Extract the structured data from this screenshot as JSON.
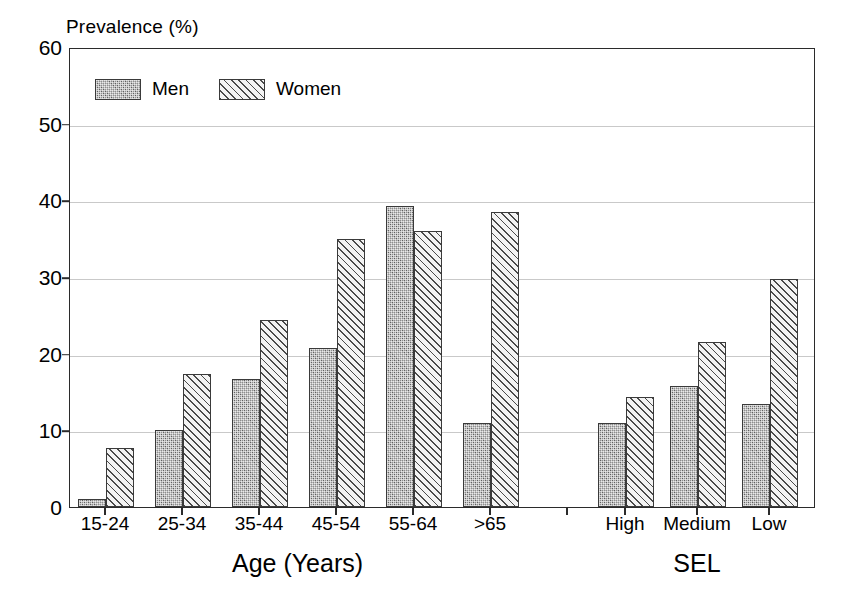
{
  "chart_data": {
    "type": "bar",
    "title": "",
    "ylabel": "Prevalence (%)",
    "xlabel": "",
    "ylim": [
      0,
      60
    ],
    "yticks": [
      0,
      10,
      20,
      30,
      40,
      50,
      60
    ],
    "grid": true,
    "legend_position": "top-left",
    "groups": [
      {
        "name": "Age (Years)",
        "categories": [
          "15-24",
          "25-34",
          "35-44",
          "45-54",
          "55-64",
          ">65"
        ],
        "series": [
          {
            "name": "Men",
            "values": [
              1.0,
              10.0,
              16.7,
              20.7,
              39.3,
              11.0
            ]
          },
          {
            "name": "Women",
            "values": [
              7.7,
              17.3,
              24.4,
              35.0,
              36.0,
              38.5
            ]
          }
        ]
      },
      {
        "name": "SEL",
        "categories": [
          "High",
          "Medium",
          "Low"
        ],
        "series": [
          {
            "name": "Men",
            "values": [
              11.0,
              15.8,
              13.5
            ]
          },
          {
            "name": "Women",
            "values": [
              14.3,
              21.5,
              29.7
            ]
          }
        ]
      }
    ],
    "legend": [
      {
        "label": "Men",
        "pattern": "stipple-dark-gray"
      },
      {
        "label": "Women",
        "pattern": "diagonal-hatch"
      }
    ]
  },
  "axis": {
    "y_title": "Prevalence (%)",
    "tick_labels": [
      "60",
      "50",
      "40",
      "30",
      "20",
      "10",
      "0"
    ]
  },
  "colors": {
    "men_fill": "#8e8e8e",
    "women_fill": "#f3f3f3",
    "outline": "#3a3a3a",
    "frame": "#2b2b2b",
    "gridline": "#c9c9c9",
    "background": "#ffffff"
  }
}
